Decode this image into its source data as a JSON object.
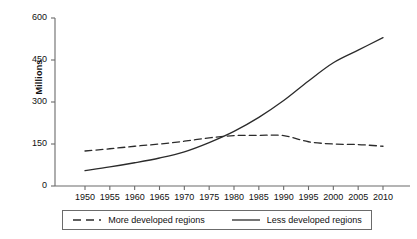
{
  "chart_data": {
    "type": "line",
    "title": "",
    "xlabel": "",
    "ylabel": "Millions",
    "xlim": [
      1950,
      2010
    ],
    "ylim": [
      0,
      600
    ],
    "grid": false,
    "legend_position": "bottom",
    "x": [
      1950,
      1955,
      1960,
      1965,
      1970,
      1975,
      1980,
      1985,
      1990,
      1995,
      2000,
      2005,
      2010
    ],
    "xtick_labels": [
      "1950",
      "1955",
      "1960",
      "1965",
      "1970",
      "1975",
      "1980",
      "1985",
      "1990",
      "1995",
      "2000",
      "2005",
      "2010"
    ],
    "ytick_labels": [
      "0",
      "150",
      "300",
      "450",
      "600"
    ],
    "ytick_values": [
      0,
      150,
      300,
      450,
      600
    ],
    "series": [
      {
        "name": "More developed regions",
        "style": "dashed",
        "color": "#2b2b2b",
        "values": [
          125,
          133,
          142,
          150,
          160,
          172,
          180,
          181,
          180,
          158,
          150,
          148,
          142
        ]
      },
      {
        "name": "Less developed regions",
        "style": "solid",
        "color": "#2b2b2b",
        "values": [
          55,
          68,
          83,
          100,
          122,
          155,
          195,
          245,
          305,
          375,
          440,
          485,
          530
        ]
      }
    ]
  },
  "legend": {
    "items": [
      {
        "label": "More developed regions",
        "style": "dashed"
      },
      {
        "label": "Less developed regions",
        "style": "solid"
      }
    ]
  },
  "axes": {
    "y_title": "Millions"
  }
}
